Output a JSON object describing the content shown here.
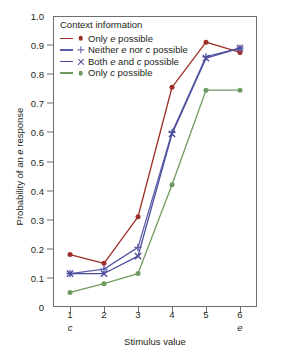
{
  "chart_data": {
    "type": "line",
    "title": "",
    "xlabel": "Stimulus value",
    "ylabel": "Probability of an e response",
    "x": [
      1,
      2,
      3,
      4,
      5,
      6
    ],
    "xticklabels": [
      "1",
      "2",
      "3",
      "4",
      "5",
      "6"
    ],
    "xtick_sublabels": [
      "c",
      "",
      "",
      "",
      "",
      "e"
    ],
    "xlim": [
      0.5,
      6.5
    ],
    "ylim": [
      0,
      1.0
    ],
    "yticklabels": [
      "0",
      "0.1",
      "0.2",
      "0.3",
      "0.4",
      "0.5",
      "0.6",
      "0.7",
      "0.8",
      "0.9",
      "1.0"
    ],
    "ytickvalues": [
      0,
      0.1,
      0.2,
      0.3,
      0.4,
      0.5,
      0.6,
      0.7,
      0.8,
      0.9,
      1.0
    ],
    "grid": false,
    "legend_title": "Context information",
    "legend_position": "upper left",
    "series": [
      {
        "name": "Only e possible",
        "marker": "dot",
        "color": "#9e2f28",
        "values": [
          0.18,
          0.15,
          0.31,
          0.755,
          0.91,
          0.875
        ]
      },
      {
        "name": "Neither e nor c possible",
        "marker": "plus",
        "color": "#5b5ea6",
        "values": [
          0.115,
          0.13,
          0.205,
          0.6,
          0.86,
          0.89
        ]
      },
      {
        "name": "Both e and c possible",
        "marker": "cross",
        "color": "#4a4b9c",
        "values": [
          0.115,
          0.115,
          0.175,
          0.595,
          0.855,
          0.89
        ]
      },
      {
        "name": "Only c possible",
        "marker": "dot",
        "color": "#6f9b60",
        "values": [
          0.05,
          0.08,
          0.115,
          0.42,
          0.745,
          0.745
        ]
      }
    ]
  },
  "axes": {
    "y_title_prefix": "Probability of an ",
    "y_title_italic": "e",
    "y_title_suffix": " response",
    "x_title": "Stimulus value"
  },
  "legend": {
    "title": "Context information",
    "items": [
      {
        "pre": "Only ",
        "em": "e",
        "post": " possible"
      },
      {
        "pre": "Neither ",
        "em": "e",
        "mid": " nor ",
        "em2": "c",
        "post": " possible"
      },
      {
        "pre": "Both ",
        "em": "e",
        "mid": " and ",
        "em2": "c",
        "post": " possible"
      },
      {
        "pre": "Only ",
        "em": "c",
        "post": " possible"
      }
    ]
  }
}
